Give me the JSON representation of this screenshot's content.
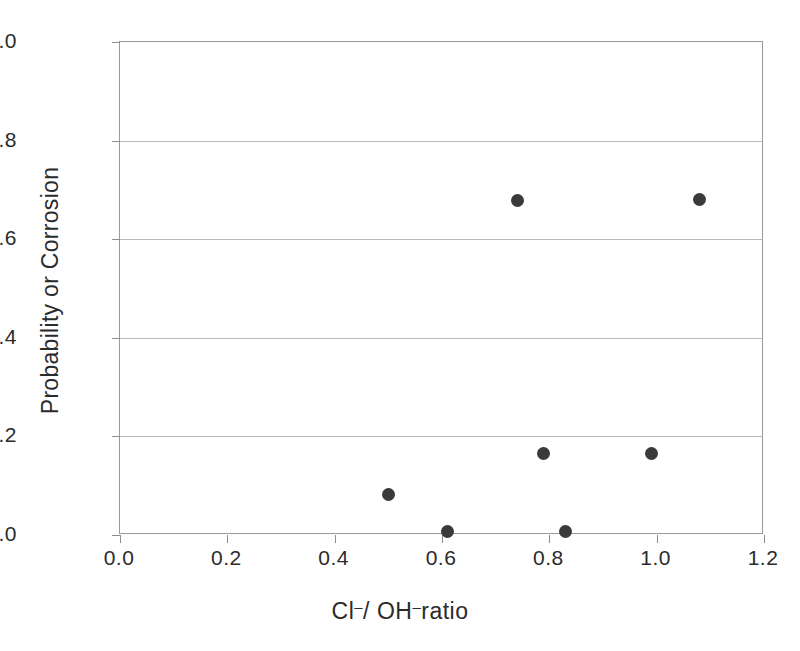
{
  "chart_data": {
    "type": "scatter",
    "title": "",
    "xlabel": "Cl⁻/ OH⁻ratio",
    "xlabel_parts": {
      "first_species": "Cl",
      "first_charge": "–",
      "separator": "/ ",
      "second_species": "OH",
      "second_charge": "–",
      "suffix": "ratio"
    },
    "ylabel": "Probability or Corrosion",
    "xlim": [
      0.0,
      1.2
    ],
    "ylim": [
      0.0,
      1.0
    ],
    "grid": true,
    "grid_axis": "y",
    "legend": "none",
    "xticks": [
      0.0,
      0.2,
      0.4,
      0.6,
      0.8,
      1.0,
      1.2
    ],
    "xticklabels": [
      "0.0",
      "0.2",
      "0.4",
      "0.6",
      "0.8",
      "1.0",
      "1.2"
    ],
    "yticks": [
      0.0,
      0.2,
      0.4,
      0.6,
      0.8,
      1.0
    ],
    "yticklabels": [
      "0.0",
      "0.2",
      "0.4",
      "0.6",
      "0.8",
      "1.0"
    ],
    "marker": "filled-circle",
    "marker_color": "#3a3a3a",
    "series": [
      {
        "name": "corrosion probability",
        "x": [
          0.5,
          0.61,
          0.74,
          0.79,
          0.83,
          0.99,
          1.08
        ],
        "y": [
          0.083,
          0.008,
          0.678,
          0.166,
          0.008,
          0.166,
          0.68
        ]
      }
    ],
    "points": [
      {
        "x": 0.5,
        "y": 0.083
      },
      {
        "x": 0.61,
        "y": 0.008
      },
      {
        "x": 0.74,
        "y": 0.678
      },
      {
        "x": 0.79,
        "y": 0.166
      },
      {
        "x": 0.83,
        "y": 0.008
      },
      {
        "x": 0.99,
        "y": 0.166
      },
      {
        "x": 1.08,
        "y": 0.68
      }
    ]
  },
  "colors": {
    "marker": "#3a3a3a",
    "frame": "#9a9a9a",
    "grid": "#b9b9b9",
    "text": "#2b2b2b",
    "background": "#ffffff"
  }
}
